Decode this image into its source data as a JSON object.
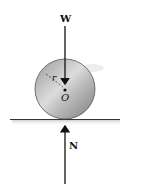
{
  "diagram": {
    "title": "",
    "labels": {
      "weight": "W",
      "normal": "N",
      "center": "O",
      "radius": "r"
    },
    "colors": {
      "disk_light": "#d8d8d8",
      "disk_dark": "#8a8a8a",
      "line": "#111111",
      "shadow": "#c8ccd0"
    }
  }
}
